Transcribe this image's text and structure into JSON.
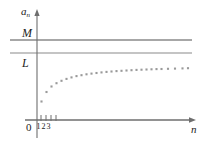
{
  "figure": {
    "name": "sequence-convergence-plot",
    "background_color": "#ffffff",
    "line_color": "#8a8a8a",
    "axis_color": "#6e6e6e",
    "dot_color": "#9a9a9a",
    "text_color": "#222222"
  },
  "labels": {
    "y_axis": "a",
    "y_axis_subscript": "n",
    "upper_bound": "M",
    "limit": "L",
    "origin": "0",
    "x_axis": "n",
    "ticks": [
      "1",
      "2",
      "3"
    ]
  },
  "chart_data": {
    "type": "scatter",
    "title": "",
    "xlabel": "n",
    "ylabel": "a_n",
    "grid": false,
    "legend": null,
    "xlim": [
      0,
      30
    ],
    "ylim": [
      0,
      10
    ],
    "annotations": [
      {
        "label": "M",
        "type": "horizontal-line",
        "y": 8.2,
        "note": "upper bound"
      },
      {
        "label": "L",
        "type": "horizontal-line",
        "y": 7.0,
        "note": "limit"
      }
    ],
    "tick_positions_x": [
      1,
      2,
      3
    ],
    "series": [
      {
        "name": "a_n",
        "x": [
          1,
          2,
          3,
          4,
          5,
          6,
          7,
          8,
          9,
          10,
          11,
          12,
          13,
          14,
          15,
          16,
          17,
          18,
          19,
          20,
          21,
          22,
          23,
          24,
          25,
          26,
          27,
          28
        ],
        "y": [
          2.05,
          3.45,
          4.25,
          4.72,
          5.08,
          5.36,
          5.58,
          5.76,
          5.9,
          6.02,
          6.12,
          6.21,
          6.29,
          6.35,
          6.41,
          6.46,
          6.5,
          6.54,
          6.58,
          6.61,
          6.64,
          6.66,
          6.69,
          6.71,
          6.72,
          6.74,
          6.76,
          6.77
        ]
      }
    ]
  },
  "geometry": {
    "y_axis_x": 37,
    "x_axis_y": 120,
    "y_axis_top": 10,
    "y_axis_bottom": 138,
    "x_axis_left": 25,
    "x_axis_right": 196,
    "m_line_y": 40,
    "l_line_y": 53,
    "h_line_left": 10,
    "h_line_right": 192,
    "tick_x": [
      41,
      46,
      51,
      56
    ],
    "tick_top": 115,
    "tick_bottom": 121,
    "dot_size": 2.1,
    "dots": [
      [
        41.5,
        101.5
      ],
      [
        46.5,
        92.0
      ],
      [
        51.5,
        86.5
      ],
      [
        56.5,
        83.2
      ],
      [
        61.5,
        80.8
      ],
      [
        66.5,
        78.9
      ],
      [
        71.5,
        77.4
      ],
      [
        76.5,
        76.1
      ],
      [
        81.5,
        75.2
      ],
      [
        86.5,
        74.3
      ],
      [
        91.5,
        73.6
      ],
      [
        96.5,
        73.0
      ],
      [
        101.5,
        72.4
      ],
      [
        106.5,
        71.9
      ],
      [
        111.5,
        71.5
      ],
      [
        116.5,
        71.1
      ],
      [
        121.5,
        70.8
      ],
      [
        126.5,
        70.5
      ],
      [
        131.5,
        70.2
      ],
      [
        136.5,
        69.9
      ],
      [
        141.5,
        69.7
      ],
      [
        146.5,
        69.5
      ],
      [
        151.5,
        69.3
      ],
      [
        156.5,
        69.1
      ],
      [
        161.5,
        69.0
      ],
      [
        168.0,
        68.8
      ],
      [
        175.0,
        68.6
      ],
      [
        182.5,
        68.4
      ],
      [
        188.0,
        68.2
      ]
    ]
  }
}
